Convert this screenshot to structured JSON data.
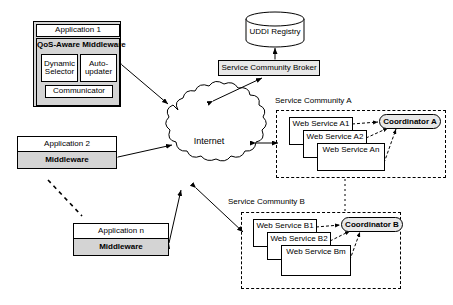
{
  "diagram": {
    "type": "architecture-diagram",
    "colors": {
      "stroke": "#000000",
      "fill_white": "#ffffff",
      "fill_grey": "#d4d4d4",
      "fill_light_grey": "#e8e8e8"
    }
  },
  "application1": {
    "title": "Application 1",
    "middleware_title": "QoS-Aware Middleware",
    "dynamic_selector": "Dynamic\nSelector",
    "dynamic_selector_line1": "Dynamic",
    "dynamic_selector_line2": "Selector",
    "auto_updater_line1": "Auto-",
    "auto_updater_line2": "updater",
    "communicator": "Communicator"
  },
  "application2": {
    "title": "Application 2",
    "middleware": "Middleware"
  },
  "applicationN": {
    "title": "Application n",
    "middleware": "Middleware"
  },
  "internet": {
    "label": "Internet"
  },
  "uddi": {
    "label": "UDDI Registry"
  },
  "broker": {
    "label": "Service Community Broker"
  },
  "communityA": {
    "label": "Service Community A",
    "services": [
      "Web Service A1",
      "Web Service A2",
      "Web Service An"
    ],
    "coordinator": "Coordinator A"
  },
  "communityB": {
    "label": "Service Community B",
    "services": [
      "Web Service B1",
      "Web Service B2",
      "Web Service Bm"
    ],
    "coordinator": "Coordinator B"
  }
}
